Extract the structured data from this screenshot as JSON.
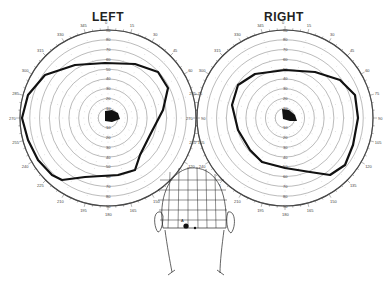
{
  "titles": {
    "left": "LEFT",
    "right": "RIGHT"
  },
  "fields": {
    "left": {
      "center": [
        108,
        118
      ],
      "radius": 88,
      "rings": [
        10,
        20,
        30,
        40,
        50,
        60,
        70,
        80,
        90
      ],
      "meridian_labels": [
        "0",
        "15",
        "30",
        "45",
        "60",
        "75",
        "90",
        "105",
        "120",
        "135",
        "150",
        "165",
        "180",
        "195",
        "210",
        "225",
        "240",
        "255",
        "270",
        "285",
        "300",
        "315",
        "330",
        "345"
      ],
      "isopter": "M22,118 L28,95 L45,75 L75,65 L105,63 L135,64 L158,72 L168,88 L163,110 L150,135 L140,155 L135,170 L118,175 L85,177 L62,180 L52,175 L38,160 L28,140 Z",
      "blind_spot": "M105,111 L112,110 L118,113 L120,119 L112,122 L105,121 Z"
    },
    "right": {
      "center": [
        285,
        118
      ],
      "radius": 88,
      "rings": [
        10,
        20,
        30,
        40,
        50,
        60,
        70,
        80,
        90
      ],
      "meridian_labels": [
        "0",
        "15",
        "30",
        "45",
        "60",
        "75",
        "90",
        "105",
        "120",
        "135",
        "150",
        "165",
        "180",
        "195",
        "210",
        "225",
        "240",
        "255",
        "270",
        "285",
        "300",
        "315",
        "330",
        "345"
      ],
      "isopter": "M238,85 L255,74 L285,70 L315,72 L340,80 L355,95 L358,118 L353,145 L345,165 L330,175 L310,172 L285,168 L262,162 L250,150 L238,130 L232,105 Z",
      "blind_spot": "M282,109 L289,110 L295,115 L297,121 L290,121 L283,119 Z"
    }
  },
  "head_diagram": {
    "label": "Lesion location",
    "marker_labels": [
      "A"
    ]
  },
  "colors": {
    "line": "#111111",
    "grid": "#666666",
    "background": "#ffffff"
  }
}
